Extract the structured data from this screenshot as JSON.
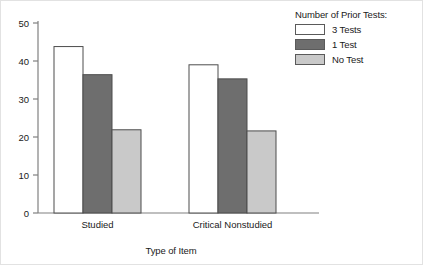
{
  "chart_data": {
    "type": "bar",
    "title": "",
    "xlabel": "Type of Item",
    "ylabel": "",
    "categories": [
      "Studied",
      "Critical Nonstudied"
    ],
    "series": [
      {
        "name": "3 Tests",
        "values": [
          43.8,
          39.0
        ],
        "color": "#ffffff"
      },
      {
        "name": "1 Test",
        "values": [
          36.4,
          35.3
        ],
        "color": "#6e6e6e"
      },
      {
        "name": "No Test",
        "values": [
          21.9,
          21.6
        ],
        "color": "#c9c9c9"
      }
    ],
    "ylim": [
      0,
      50
    ],
    "yticks": [
      0,
      10,
      20,
      30,
      40,
      50
    ],
    "ytick_labels": [
      "0",
      "10",
      "20",
      "30",
      "40",
      "50"
    ],
    "grid": false,
    "legend_position": "top-right",
    "legend_title": "Number of Prior Tests:",
    "bar_edge_color": "#4d4d4d",
    "axis_color": "#808080"
  },
  "legend": {
    "title": "Number of Prior Tests:",
    "items": [
      {
        "label": "3 Tests"
      },
      {
        "label": "1 Test"
      },
      {
        "label": "No Test"
      }
    ]
  },
  "axes": {
    "x_title": "Type of Item"
  }
}
